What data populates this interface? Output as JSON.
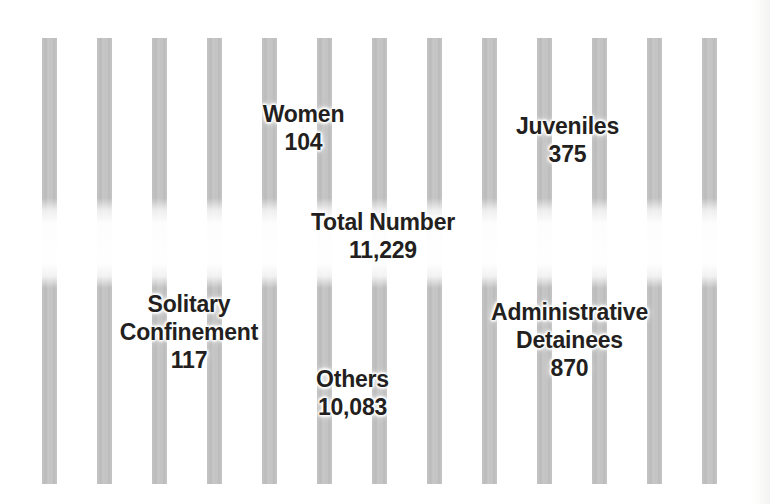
{
  "figure": {
    "motif": "prison-bars",
    "background_color": "#ffffff",
    "bar_color": "#c4c4c4",
    "text_color": "#231f20"
  },
  "bars": {
    "count": 13,
    "first_x": 42,
    "spacing": 55,
    "width": 15,
    "top": 38,
    "bottom": 484,
    "fade_band_top": 203,
    "fade_band_bottom": 278
  },
  "labels": [
    {
      "id": "women",
      "title": "Women",
      "value": "104"
    },
    {
      "id": "juveniles",
      "title": "Juveniles",
      "value": "375"
    },
    {
      "id": "total",
      "title": "Total Number",
      "value": "11,229"
    },
    {
      "id": "solitary",
      "title": "Solitary Confinement",
      "title_line1": "Solitary",
      "title_line2": "Confinement",
      "value": "117"
    },
    {
      "id": "others",
      "title": "Others",
      "value": "10,083"
    },
    {
      "id": "admin",
      "title": "Administrative Detainees",
      "title_line1": "Administrative",
      "title_line2": "Detainees",
      "value": "870"
    }
  ],
  "chart_data": {
    "type": "table",
    "title": "Total Number 11,229",
    "categories": [
      "Women",
      "Juveniles",
      "Solitary Confinement",
      "Administrative Detainees",
      "Others"
    ],
    "values": [
      104,
      375,
      117,
      870,
      10083
    ],
    "total_label": "Total Number",
    "total": 11229,
    "xlabel": "",
    "ylabel": "",
    "grid": false,
    "legend": "none"
  }
}
